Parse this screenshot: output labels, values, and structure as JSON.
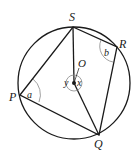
{
  "diagram": {
    "type": "circle-geometry",
    "center": {
      "label": "O",
      "x": 74,
      "y": 83
    },
    "radius": 56,
    "points": {
      "S": {
        "label": "S",
        "x": 73,
        "y": 27
      },
      "R": {
        "label": "R",
        "x": 117,
        "y": 47
      },
      "Q": {
        "label": "Q",
        "x": 99,
        "y": 135
      },
      "P": {
        "label": "P",
        "x": 20,
        "y": 95
      }
    },
    "angles": {
      "a": {
        "label": "a",
        "at": "P"
      },
      "b": {
        "label": "b",
        "at": "R"
      },
      "x": {
        "label": "x",
        "at": "O"
      },
      "y": {
        "label": "y",
        "at": "O"
      }
    },
    "colors": {
      "stroke": "#1a1a1a",
      "arc": "#888888"
    }
  }
}
